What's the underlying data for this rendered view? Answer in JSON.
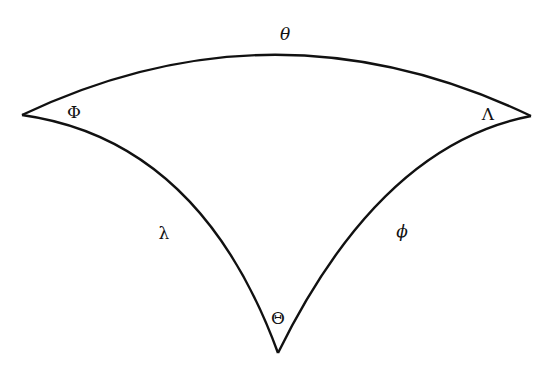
{
  "diagram": {
    "type": "spherical-triangle",
    "stroke_color": "#111111",
    "background": "#ffffff",
    "sides": [
      {
        "id": "top",
        "label": "θ"
      },
      {
        "id": "left",
        "label": "λ"
      },
      {
        "id": "right",
        "label": "ϕ"
      }
    ],
    "angles": [
      {
        "id": "left-vertex",
        "label": "Φ"
      },
      {
        "id": "right-vertex",
        "label": "Λ"
      },
      {
        "id": "bottom-vertex",
        "label": "Θ"
      }
    ]
  }
}
